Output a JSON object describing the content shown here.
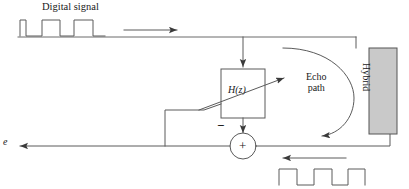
{
  "diagram": {
    "labels": {
      "digital_signal": "Digital signal",
      "echo_path": "Echo\npath",
      "filter": "H(z)",
      "hybrid": "Hybrid",
      "error_signal": "e",
      "minus_sign": "−",
      "plus_sign": "+"
    },
    "colors": {
      "line": "#4a4a4a",
      "text": "#1a1a1a",
      "hybrid_fill": "#c9c9c9",
      "hybrid_stroke": "#555555",
      "background": "#ffffff"
    },
    "blocks": [
      {
        "name": "filter",
        "label": "H(z)",
        "shape": "rectangle",
        "fill": "none"
      },
      {
        "name": "hybrid",
        "label": "Hybrid",
        "shape": "rectangle",
        "fill": "#c9c9c9"
      },
      {
        "name": "summer",
        "label": "+",
        "shape": "circle",
        "fill": "none"
      }
    ],
    "signals": [
      {
        "name": "digital-signal-waveform",
        "type": "square-wave",
        "position": "top-left",
        "pulses": 3
      },
      {
        "name": "received-signal-waveform",
        "type": "square-wave",
        "position": "bottom-right",
        "pulses": 3
      }
    ],
    "arrows": [
      {
        "name": "input-flow-arrow",
        "direction": "right"
      },
      {
        "name": "filter-input-arrow",
        "direction": "down"
      },
      {
        "name": "filter-output-arrow",
        "direction": "down"
      },
      {
        "name": "echo-path-entry-arrow",
        "direction": "up-right"
      },
      {
        "name": "echo-path-return-arrow",
        "direction": "left"
      },
      {
        "name": "receive-flow-arrow",
        "direction": "left"
      },
      {
        "name": "error-output-arrow",
        "direction": "left"
      }
    ]
  }
}
